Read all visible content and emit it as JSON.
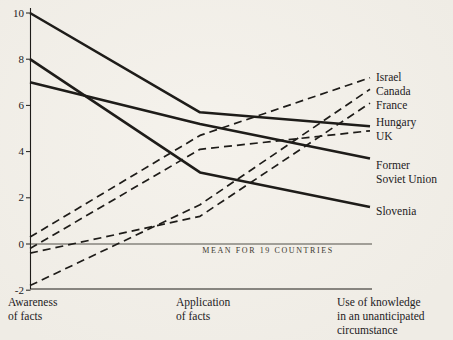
{
  "figure": {
    "background": "#f2efe9",
    "ink": "#1e1c19"
  },
  "chart_data": {
    "type": "line",
    "title": "",
    "xlabel": "",
    "ylabel": "",
    "categories": [
      "Awareness\nof facts",
      "Application\nof facts",
      "Use of knowledge\nin an unanticipated\ncircumstance"
    ],
    "ylim": [
      -2,
      10
    ],
    "yticks": [
      10,
      8,
      6,
      4,
      2,
      0,
      -2
    ],
    "grid": false,
    "legend_position": "right",
    "mean_line": {
      "value": 0,
      "label": "MEAN FOR 19 COUNTRIES"
    },
    "series": [
      {
        "name": "Israel",
        "label": "Israel",
        "style": "dashed",
        "values": [
          0.3,
          4.7,
          7.2
        ]
      },
      {
        "name": "Canada",
        "label": "Canada",
        "style": "dashed",
        "values": [
          -1.8,
          1.7,
          6.7
        ]
      },
      {
        "name": "France",
        "label": "France",
        "style": "dashed",
        "values": [
          -0.4,
          1.2,
          6.1
        ]
      },
      {
        "name": "Hungary",
        "label": "Hungary",
        "style": "solid",
        "values": [
          10.0,
          5.7,
          5.1
        ]
      },
      {
        "name": "UK",
        "label": "UK",
        "style": "dashed",
        "values": [
          -0.2,
          4.1,
          4.9
        ]
      },
      {
        "name": "Former Soviet Union",
        "label": "Former\nSoviet Union",
        "style": "solid",
        "values": [
          7.0,
          5.2,
          3.7
        ]
      },
      {
        "name": "Slovenia",
        "label": "Slovenia",
        "style": "solid",
        "values": [
          8.0,
          3.1,
          1.6
        ]
      }
    ]
  }
}
